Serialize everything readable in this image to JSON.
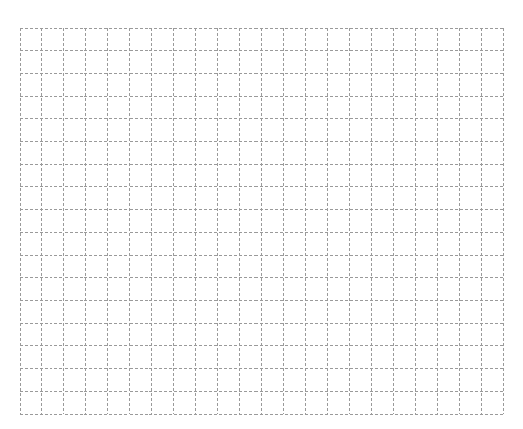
{
  "canvas": {
    "width": 523,
    "height": 429,
    "background": "#ffffff"
  },
  "grid": {
    "left": 19.5,
    "top": 27.5,
    "right": 502.5,
    "bottom": 413.5,
    "columns": 22,
    "rows": 17,
    "line_color": "#9a9a9a",
    "line_width": 1,
    "dash_pattern": "3 2",
    "cells": []
  }
}
